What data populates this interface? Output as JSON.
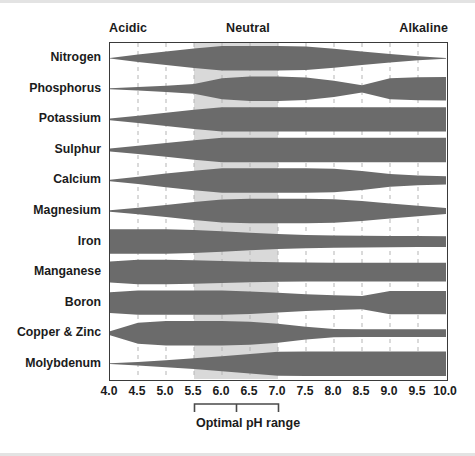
{
  "chart_data": {
    "type": "area",
    "title": "",
    "subtitle": "",
    "xlabel": "",
    "ylabel": "",
    "xlim": [
      4.0,
      10.0
    ],
    "grid": true,
    "grid_style": "vertical dashed gridlines at every 0.5 pH tick",
    "legend": "none",
    "optimal_range": [
      5.5,
      7.0
    ],
    "optimal_range_caption": "Optimal pH range",
    "band_color": "#6b6b6b",
    "optimal_shade_color": "#d9d9d9",
    "frame_color": "#3a3a3a",
    "gridline_color": "#b5b5b5",
    "text_color": "#1b1b1b",
    "zone_labels": [
      {
        "name": "Acidic",
        "ph": 4.0,
        "align": "left"
      },
      {
        "name": "Neutral",
        "ph": 7.0,
        "align": "center"
      },
      {
        "name": "Alkaline",
        "ph": 10.0,
        "align": "right"
      }
    ],
    "x_ticks": [
      4.0,
      4.5,
      5.0,
      5.5,
      6.0,
      6.5,
      7.0,
      7.5,
      8.0,
      8.5,
      9.0,
      9.5,
      10.0
    ],
    "x_tick_labels": [
      "4.0",
      "4.5",
      "5.0",
      "5.5",
      "6.0",
      "6.5",
      "7.0",
      "7.5",
      "8.0",
      "8.5",
      "9.0",
      "9.5",
      "10.0"
    ],
    "categories": [
      "Nitrogen",
      "Phosphorus",
      "Potassium",
      "Sulphur",
      "Calcium",
      "Magnesium",
      "Iron",
      "Manganese",
      "Boron",
      "Copper & Zinc",
      "Molybdenum"
    ],
    "series": [
      {
        "name": "Nitrogen",
        "x": [
          4.0,
          4.5,
          5.0,
          5.5,
          6.0,
          6.5,
          7.0,
          7.5,
          8.0,
          8.5,
          9.0,
          9.5,
          10.0
        ],
        "values": [
          0.02,
          0.3,
          0.56,
          0.8,
          1.0,
          1.0,
          1.0,
          0.96,
          0.78,
          0.56,
          0.34,
          0.16,
          0.03
        ]
      },
      {
        "name": "Phosphorus",
        "x": [
          4.0,
          4.5,
          5.0,
          5.5,
          6.0,
          6.5,
          7.0,
          7.5,
          8.0,
          8.5,
          9.0,
          9.5,
          10.0
        ],
        "values": [
          0.04,
          0.14,
          0.26,
          0.4,
          0.86,
          1.0,
          1.0,
          0.92,
          0.66,
          0.3,
          0.86,
          0.94,
          0.96
        ]
      },
      {
        "name": "Potassium",
        "x": [
          4.0,
          4.5,
          5.0,
          5.5,
          6.0,
          6.5,
          7.0,
          7.5,
          8.0,
          8.5,
          9.0,
          9.5,
          10.0
        ],
        "values": [
          0.08,
          0.3,
          0.54,
          0.78,
          1.0,
          1.0,
          1.0,
          1.0,
          1.0,
          1.0,
          1.0,
          1.0,
          1.0
        ]
      },
      {
        "name": "Sulphur",
        "x": [
          4.0,
          4.5,
          5.0,
          5.5,
          6.0,
          6.5,
          7.0,
          7.5,
          8.0,
          8.5,
          9.0,
          9.5,
          10.0
        ],
        "values": [
          0.12,
          0.34,
          0.56,
          0.8,
          1.0,
          1.0,
          1.0,
          1.0,
          1.0,
          1.0,
          1.0,
          1.0,
          1.0
        ]
      },
      {
        "name": "Calcium",
        "x": [
          4.0,
          4.5,
          5.0,
          5.5,
          6.0,
          6.5,
          7.0,
          7.5,
          8.0,
          8.5,
          9.0,
          9.5,
          10.0
        ],
        "values": [
          0.06,
          0.3,
          0.56,
          0.8,
          1.0,
          1.0,
          1.0,
          1.0,
          0.96,
          0.78,
          0.52,
          0.4,
          0.34
        ]
      },
      {
        "name": "Magnesium",
        "x": [
          4.0,
          4.5,
          5.0,
          5.5,
          6.0,
          6.5,
          7.0,
          7.5,
          8.0,
          8.5,
          9.0,
          9.5,
          10.0
        ],
        "values": [
          0.06,
          0.26,
          0.5,
          0.74,
          0.94,
          1.0,
          1.0,
          1.0,
          0.96,
          0.82,
          0.62,
          0.42,
          0.24
        ]
      },
      {
        "name": "Iron",
        "x": [
          4.0,
          4.5,
          5.0,
          5.5,
          6.0,
          6.5,
          7.0,
          7.5,
          8.0,
          8.5,
          9.0,
          9.5,
          10.0
        ],
        "values": [
          1.0,
          1.0,
          1.0,
          0.94,
          0.84,
          0.72,
          0.62,
          0.54,
          0.5,
          0.48,
          0.46,
          0.45,
          0.44
        ]
      },
      {
        "name": "Manganese",
        "x": [
          4.0,
          4.5,
          5.0,
          5.5,
          6.0,
          6.5,
          7.0,
          7.5,
          8.0,
          8.5,
          9.0,
          9.5,
          10.0
        ],
        "values": [
          0.86,
          1.0,
          1.0,
          0.96,
          0.9,
          0.84,
          0.8,
          0.78,
          0.76,
          0.76,
          0.76,
          0.76,
          0.76
        ]
      },
      {
        "name": "Boron",
        "x": [
          4.0,
          4.5,
          5.0,
          5.5,
          6.0,
          6.5,
          7.0,
          7.5,
          8.0,
          8.5,
          9.0,
          9.5,
          10.0
        ],
        "values": [
          0.84,
          1.0,
          1.0,
          1.0,
          1.0,
          0.92,
          0.8,
          0.68,
          0.6,
          0.54,
          0.96,
          0.96,
          0.96
        ]
      },
      {
        "name": "Copper & Zinc",
        "x": [
          4.0,
          4.5,
          5.0,
          5.5,
          6.0,
          6.5,
          7.0,
          7.5,
          8.0,
          8.5,
          9.0,
          9.5,
          10.0
        ],
        "values": [
          0.16,
          0.86,
          1.0,
          1.0,
          1.0,
          0.94,
          0.78,
          0.52,
          0.34,
          0.32,
          0.32,
          0.32,
          0.32
        ]
      },
      {
        "name": "Molybdenum",
        "x": [
          4.0,
          4.5,
          5.0,
          5.5,
          6.0,
          6.5,
          7.0,
          7.5,
          8.0,
          8.5,
          9.0,
          9.5,
          10.0
        ],
        "values": [
          0.03,
          0.14,
          0.28,
          0.44,
          0.62,
          0.8,
          0.98,
          1.0,
          1.0,
          1.0,
          1.0,
          1.0,
          1.0
        ]
      }
    ]
  }
}
